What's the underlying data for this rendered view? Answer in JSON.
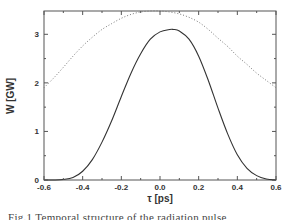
{
  "chart_data": {
    "type": "line",
    "title": "",
    "xlabel": "τ [ps]",
    "ylabel": "W [GW]",
    "xlim": [
      -0.6,
      0.6
    ],
    "ylim": [
      0,
      3.48
    ],
    "xticks": [
      -0.6,
      -0.4,
      -0.2,
      0.0,
      0.2,
      0.4,
      0.6
    ],
    "xtick_labels": [
      "-0.6",
      "-0.4",
      "-0.2",
      "0.0",
      "0.2",
      "0.4",
      "0.6"
    ],
    "yticks": [
      0,
      1,
      2,
      3
    ],
    "ytick_labels": [
      "0",
      "1",
      "2",
      "3"
    ],
    "grid": false,
    "legend": null,
    "series": [
      {
        "name": "solid",
        "style": "solid",
        "x": [
          -0.6,
          -0.55,
          -0.5,
          -0.45,
          -0.4,
          -0.35,
          -0.3,
          -0.25,
          -0.2,
          -0.15,
          -0.1,
          -0.05,
          0.0,
          0.05,
          0.07,
          0.1,
          0.15,
          0.2,
          0.25,
          0.3,
          0.35,
          0.4,
          0.45,
          0.5,
          0.55,
          0.6
        ],
        "values": [
          0,
          0,
          0.01,
          0.05,
          0.18,
          0.42,
          0.78,
          1.22,
          1.72,
          2.2,
          2.6,
          2.9,
          3.05,
          3.1,
          3.1,
          3.07,
          2.9,
          2.55,
          2.05,
          1.48,
          0.95,
          0.52,
          0.24,
          0.09,
          0.02,
          0
        ]
      },
      {
        "name": "dotted",
        "style": "dotted",
        "x": [
          -0.6,
          -0.55,
          -0.5,
          -0.45,
          -0.4,
          -0.35,
          -0.3,
          -0.25,
          -0.2,
          -0.15,
          -0.1,
          -0.05,
          0.0,
          0.05,
          0.1,
          0.15,
          0.2,
          0.25,
          0.3,
          0.35,
          0.4,
          0.45,
          0.5,
          0.55,
          0.6
        ],
        "values": [
          1.9,
          2.1,
          2.32,
          2.55,
          2.76,
          2.94,
          3.1,
          3.22,
          3.33,
          3.41,
          3.46,
          3.48,
          3.48,
          3.46,
          3.42,
          3.35,
          3.25,
          3.1,
          2.92,
          2.75,
          2.55,
          2.38,
          2.2,
          2.05,
          1.9
        ]
      }
    ]
  },
  "caption": "Fig.1 Temporal structure of the radiation pulse"
}
